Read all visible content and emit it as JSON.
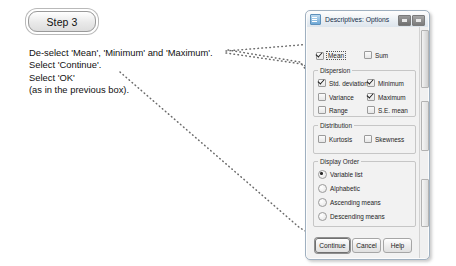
{
  "step": {
    "badge_label": "Step 3"
  },
  "instructions": {
    "lines": [
      "De-select 'Mean', 'Minimum' and 'Maximum'.",
      "Select 'Continue'.",
      "Select 'OK'",
      "(as in the previous box)."
    ]
  },
  "dialog": {
    "title": "Descriptives: Options",
    "title_icon": "dialog-icon",
    "window_buttons": [
      {
        "name": "minimize-button",
        "label": "–"
      },
      {
        "name": "close-button",
        "label": "×"
      }
    ],
    "top_options": [
      {
        "name": "mean",
        "label": "Mean",
        "mnemonic": "M",
        "checked": true,
        "focused": true
      },
      {
        "name": "sum",
        "label": "Sum",
        "mnemonic": "S",
        "checked": false,
        "focused": false
      }
    ],
    "groups": [
      {
        "name": "dispersion",
        "title": "Dispersion",
        "options": [
          {
            "name": "std-deviation",
            "label": "Std. deviation",
            "checked": true
          },
          {
            "name": "minimum",
            "label": "Minimum",
            "checked": true
          },
          {
            "name": "variance",
            "label": "Variance",
            "checked": false
          },
          {
            "name": "maximum",
            "label": "Maximum",
            "checked": true
          },
          {
            "name": "range",
            "label": "Range",
            "checked": false
          },
          {
            "name": "se-mean",
            "label": "S.E. mean",
            "checked": false
          }
        ]
      },
      {
        "name": "distribution",
        "title": "Distribution",
        "options": [
          {
            "name": "kurtosis",
            "label": "Kurtosis",
            "checked": false
          },
          {
            "name": "skewness",
            "label": "Skewness",
            "checked": false
          }
        ]
      },
      {
        "name": "display-order",
        "title": "Display Order",
        "options": [
          {
            "name": "variable-list",
            "label": "Variable list",
            "selected": true
          },
          {
            "name": "alphabetic",
            "label": "Alphabetic",
            "selected": false
          },
          {
            "name": "ascending-means",
            "label": "Ascending means",
            "selected": false
          },
          {
            "name": "descending-means",
            "label": "Descending means",
            "selected": false
          }
        ]
      }
    ],
    "buttons": [
      {
        "name": "continue",
        "label": "Continue",
        "default": true
      },
      {
        "name": "cancel",
        "label": "Cancel",
        "default": false
      },
      {
        "name": "help",
        "label": "Help",
        "default": false
      }
    ]
  },
  "colors": {
    "dotted_line": "#6b6b6b",
    "dialog_border": "#9fb0c0",
    "titlebar_text": "#17304a",
    "page_background": "#ffffff"
  }
}
